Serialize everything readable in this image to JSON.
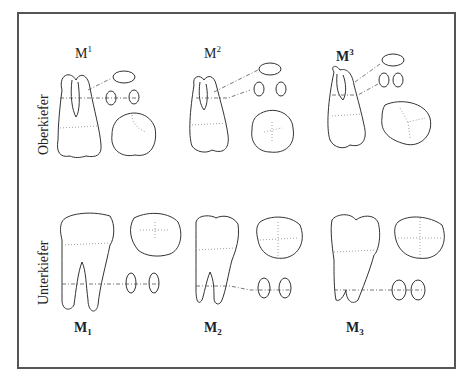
{
  "figure": {
    "rows": [
      {
        "label": "Oberkiefer",
        "teeth": [
          {
            "name": "M",
            "index": "1",
            "position": "sup"
          },
          {
            "name": "M",
            "index": "2",
            "position": "sup"
          },
          {
            "name": "M",
            "index": "3",
            "position": "sup"
          }
        ]
      },
      {
        "label": "Unterkiefer",
        "teeth": [
          {
            "name": "M",
            "index": "1",
            "position": "sub"
          },
          {
            "name": "M",
            "index": "2",
            "position": "sub"
          },
          {
            "name": "M",
            "index": "3",
            "position": "sub"
          }
        ]
      }
    ]
  }
}
